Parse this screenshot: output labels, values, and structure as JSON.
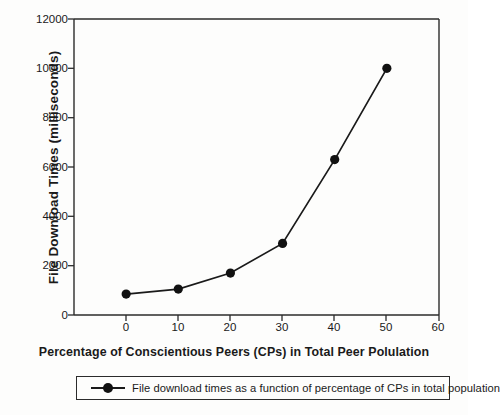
{
  "chart_data": {
    "type": "line",
    "title": "",
    "xlabel": "Percentage of Conscientious Peers (CPs) in Total Peer Polulation",
    "ylabel": "File Download Times  (milliseconds)",
    "x": [
      0,
      10,
      20,
      30,
      40,
      50
    ],
    "values": [
      850,
      1050,
      1700,
      2900,
      6300,
      10000
    ],
    "series": [
      {
        "name": "File download times as a function of percentage of CPs in total population",
        "values": [
          850,
          1050,
          1700,
          2900,
          6300,
          10000
        ]
      }
    ],
    "xlim": [
      -10,
      60
    ],
    "ylim": [
      0,
      12000
    ],
    "xticks": [
      0,
      10,
      20,
      30,
      40,
      50,
      60
    ],
    "xtick_labels": [
      "0",
      "10",
      "20",
      "30",
      "40",
      "50",
      "60"
    ],
    "yticks": [
      0,
      2000,
      4000,
      6000,
      8000,
      10000,
      12000
    ],
    "ytick_labels": [
      "0",
      "2000",
      "4000",
      "6000",
      "8000",
      "10000",
      "12000"
    ],
    "grid": false,
    "legend_position": "below",
    "marker": "circle",
    "line_color": "#1a1a1a",
    "marker_color": "#111111",
    "axis_color": "#2b2b2b",
    "background_color": "#fdfdfc"
  },
  "legend": {
    "entries": [
      {
        "label": "File download times as a function of percentage of CPs in total population"
      }
    ]
  }
}
